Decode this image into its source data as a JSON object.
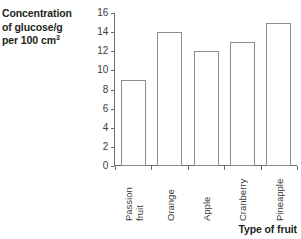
{
  "chart_data": {
    "type": "bar",
    "title": "",
    "categories": [
      "Passion fruit",
      "Orange",
      "Apple",
      "Cranberry",
      "Pineapple"
    ],
    "values": [
      9,
      14,
      12,
      13,
      15
    ],
    "xlabel": "Type of fruit",
    "ylabel": "Concentration of glucose/g per 100 cm3",
    "ylim": [
      0,
      16
    ],
    "ytick_step": 2,
    "ytick_labels": [
      "16",
      "14",
      "12",
      "10",
      "8",
      "6",
      "4",
      "2",
      "0"
    ],
    "grid": false,
    "legend": false,
    "bar_fill": "#ffffff",
    "bar_outline": "#8d8d8d",
    "axis_color": "#6d6d6d",
    "background": "#ffffff"
  },
  "yaxis": {
    "title_line1": "Concentration",
    "title_line2": "of glucose/g",
    "title_line3_prefix": "per 100 cm",
    "title_line3_sup": "3"
  },
  "xaxis": {
    "title": "Type of fruit"
  },
  "categories_wrapped": [
    {
      "line1": "Passion",
      "line2": "fruit"
    },
    {
      "line1": "Orange",
      "line2": ""
    },
    {
      "line1": "Apple",
      "line2": ""
    },
    {
      "line1": "Cranberry",
      "line2": ""
    },
    {
      "line1": "Pineapple",
      "line2": ""
    }
  ]
}
